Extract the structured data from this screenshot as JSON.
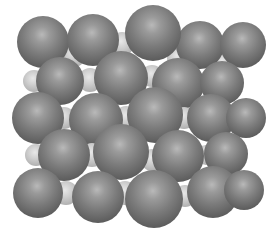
{
  "image": {
    "subject": "crystal lattice sphere model",
    "background": "#ffffff",
    "large_sphere_color": "#7c7c7c",
    "small_sphere_color": "#cfcfcf"
  },
  "spheres": [
    {
      "type": "small",
      "x": 74,
      "y": 55,
      "r": 12
    },
    {
      "type": "small",
      "x": 122,
      "y": 44,
      "r": 12
    },
    {
      "type": "small",
      "x": 178,
      "y": 58,
      "r": 11
    },
    {
      "type": "small",
      "x": 223,
      "y": 63,
      "r": 10
    },
    {
      "type": "big",
      "x": 43,
      "y": 42,
      "r": 26
    },
    {
      "type": "big",
      "x": 93,
      "y": 40,
      "r": 26
    },
    {
      "type": "big",
      "x": 200,
      "y": 45,
      "r": 24
    },
    {
      "type": "big",
      "x": 243,
      "y": 45,
      "r": 23
    },
    {
      "type": "big",
      "x": 153,
      "y": 33,
      "r": 28
    },
    {
      "type": "small",
      "x": 34,
      "y": 81,
      "r": 11
    },
    {
      "type": "small",
      "x": 90,
      "y": 80,
      "r": 12
    },
    {
      "type": "small",
      "x": 152,
      "y": 76,
      "r": 11
    },
    {
      "type": "small",
      "x": 207,
      "y": 81,
      "r": 10
    },
    {
      "type": "big",
      "x": 60,
      "y": 81,
      "r": 24
    },
    {
      "type": "big",
      "x": 178,
      "y": 84,
      "r": 26
    },
    {
      "type": "big",
      "x": 222,
      "y": 83,
      "r": 22
    },
    {
      "type": "big",
      "x": 121,
      "y": 78,
      "r": 27
    },
    {
      "type": "small",
      "x": 64,
      "y": 118,
      "r": 11
    },
    {
      "type": "small",
      "x": 126,
      "y": 118,
      "r": 12
    },
    {
      "type": "small",
      "x": 184,
      "y": 118,
      "r": 11
    },
    {
      "type": "small",
      "x": 236,
      "y": 118,
      "r": 10
    },
    {
      "type": "big",
      "x": 38,
      "y": 118,
      "r": 26
    },
    {
      "type": "big",
      "x": 96,
      "y": 120,
      "r": 27
    },
    {
      "type": "big",
      "x": 211,
      "y": 118,
      "r": 24
    },
    {
      "type": "big",
      "x": 246,
      "y": 118,
      "r": 20
    },
    {
      "type": "big",
      "x": 155,
      "y": 115,
      "r": 28
    },
    {
      "type": "small",
      "x": 36,
      "y": 155,
      "r": 11
    },
    {
      "type": "small",
      "x": 92,
      "y": 155,
      "r": 12
    },
    {
      "type": "small",
      "x": 152,
      "y": 160,
      "r": 11
    },
    {
      "type": "small",
      "x": 206,
      "y": 155,
      "r": 10
    },
    {
      "type": "big",
      "x": 64,
      "y": 155,
      "r": 26
    },
    {
      "type": "big",
      "x": 178,
      "y": 156,
      "r": 26
    },
    {
      "type": "big",
      "x": 226,
      "y": 154,
      "r": 22
    },
    {
      "type": "big",
      "x": 121,
      "y": 152,
      "r": 28
    },
    {
      "type": "small",
      "x": 66,
      "y": 193,
      "r": 12
    },
    {
      "type": "small",
      "x": 125,
      "y": 193,
      "r": 12
    },
    {
      "type": "small",
      "x": 185,
      "y": 196,
      "r": 11
    },
    {
      "type": "small",
      "x": 232,
      "y": 190,
      "r": 10
    },
    {
      "type": "big",
      "x": 38,
      "y": 193,
      "r": 25
    },
    {
      "type": "big",
      "x": 98,
      "y": 197,
      "r": 26
    },
    {
      "type": "big",
      "x": 213,
      "y": 192,
      "r": 26
    },
    {
      "type": "big",
      "x": 244,
      "y": 190,
      "r": 20
    },
    {
      "type": "big",
      "x": 154,
      "y": 199,
      "r": 29
    }
  ]
}
